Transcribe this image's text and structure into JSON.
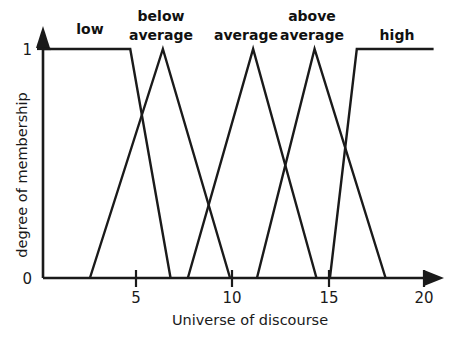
{
  "chart_data": {
    "type": "line",
    "title": "",
    "xlabel": "Universe of discourse",
    "ylabel": "degree of membership",
    "xlim": [
      0,
      21
    ],
    "ylim": [
      0,
      1.05
    ],
    "grid": false,
    "legend": "none",
    "x_ticks": [
      {
        "value": 5,
        "label": "5"
      },
      {
        "value": 10,
        "label": "10"
      },
      {
        "value": 15,
        "label": "15"
      },
      {
        "value": 20,
        "label": "20"
      }
    ],
    "y_ticks": [
      {
        "value": 0,
        "label": "0"
      },
      {
        "value": 1,
        "label": "1"
      }
    ],
    "series": [
      {
        "name": "low",
        "label": "low",
        "shape": "trapezoid-left",
        "label_x": 6.1,
        "points": [
          [
            0.2,
            1
          ],
          [
            4.7,
            1
          ],
          [
            6.8,
            0
          ]
        ]
      },
      {
        "name": "below average",
        "label": "below average",
        "shape": "triangle",
        "label_x": 6.3,
        "points": [
          [
            2.6,
            0
          ],
          [
            6.4,
            1
          ],
          [
            9.9,
            0
          ]
        ]
      },
      {
        "name": "average",
        "label": "average",
        "shape": "triangle",
        "label_x": 11.0,
        "points": [
          [
            7.7,
            0
          ],
          [
            11.1,
            1
          ],
          [
            14.4,
            0
          ]
        ]
      },
      {
        "name": "above average",
        "label": "above average",
        "shape": "triangle",
        "label_x": 14.3,
        "points": [
          [
            11.3,
            0
          ],
          [
            14.3,
            1
          ],
          [
            18.0,
            0
          ]
        ]
      },
      {
        "name": "high",
        "label": "high",
        "shape": "trapezoid-right",
        "label_x": 18.6,
        "points": [
          [
            15.1,
            0
          ],
          [
            16.5,
            1
          ],
          [
            20.5,
            1
          ]
        ]
      }
    ]
  },
  "labels": {
    "low": "low",
    "below_line1": "below",
    "below_line2": "average",
    "average": "average",
    "above_line1": "above",
    "above_line2": "average",
    "high": "high",
    "y_zero": "0",
    "y_one": "1",
    "x_tick_5": "5",
    "x_tick_10": "10",
    "x_tick_15": "15",
    "x_tick_20": "20",
    "x_axis_title": "Universe of discourse",
    "y_axis_title": "degree of membership"
  },
  "colors": {
    "ink": "#1a1a1a",
    "background": "#ffffff"
  }
}
